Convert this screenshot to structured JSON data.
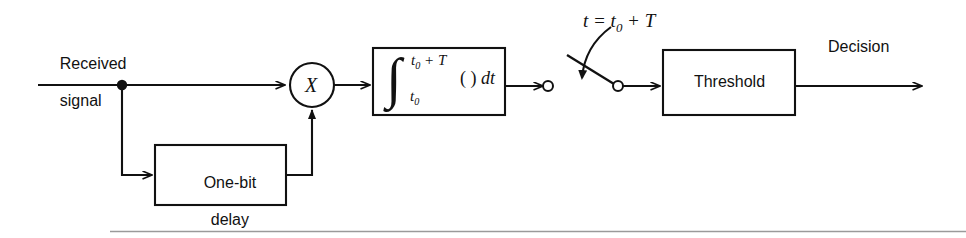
{
  "figure": {
    "kind": "block-diagram",
    "background_color": "#ffffff",
    "line_color": "#111111"
  },
  "labels": {
    "input_line1": "Received",
    "input_line2": "signal",
    "multiplier": "X",
    "delay_line1": "One-bit",
    "delay_line2": "delay",
    "threshold": "Threshold",
    "output": "Decision",
    "switch_time": "t = t",
    "switch_time_sub": "0",
    "switch_time_tail": " + T"
  },
  "integrator": {
    "symbol": "∫",
    "upper_limit_main": "t",
    "upper_limit_sub": "0",
    "upper_limit_tail": " + T",
    "lower_limit_main": "t",
    "lower_limit_sub": "0",
    "integrand": "( ) ",
    "differential": "dt"
  },
  "blocks": [
    {
      "name": "one-bit-delay",
      "x": 155,
      "y": 145,
      "w": 131,
      "h": 60
    },
    {
      "name": "integrator",
      "x": 373,
      "y": 48,
      "w": 132,
      "h": 67
    },
    {
      "name": "threshold",
      "x": 663,
      "y": 50,
      "w": 132,
      "h": 65
    }
  ],
  "nodes": {
    "junction_dot": {
      "x": 122,
      "y": 85
    },
    "multiplier_circle": {
      "cx": 312,
      "cy": 85,
      "r": 22
    },
    "switch_left_terminal": {
      "cx": 548,
      "cy": 86,
      "r": 5
    },
    "switch_right_terminal": {
      "cx": 615,
      "cy": 86,
      "r": 5
    }
  },
  "signal_flow": [
    "Received signal",
    "junction",
    "One-bit delay",
    "X multiplier",
    "integrator",
    "sampling switch at t = t0 + T",
    "Threshold",
    "Decision"
  ]
}
